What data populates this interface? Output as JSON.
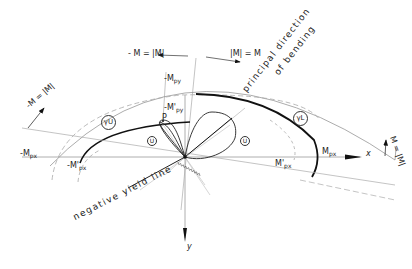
{
  "diagram": {
    "type": "yield-curve-diagram",
    "axes": {
      "x_label": "x",
      "y_label": "y"
    },
    "labels": {
      "minus_M_abs_top": "- M = |M|",
      "abs_M_eq_M": "|M| = M",
      "minus_M_abs_left": "-M = |M|",
      "M_abs_right": "M = |M|",
      "minus_Mpy": "-M",
      "minus_Mpy_sub": "py",
      "minus_Mpy_prime": "-M'",
      "minus_Mpy_prime_sub": "py",
      "minus_Mpx": "-M",
      "minus_Mpx_sub": "px",
      "minus_Mpx_prime": "-M'",
      "minus_Mpx_prime_sub": "px",
      "Mpx": "M",
      "Mpx_sub": "px",
      "Mpx_prime": "M'",
      "Mpx_prime_sub": "px",
      "point_P": "P",
      "gamma_U": "γU",
      "gamma_L": "γL",
      "U_left": "U",
      "U_right": "U",
      "principal_direction": "principal direction",
      "of_bending": "of bending",
      "negative_yield_line": "negative yield line"
    }
  }
}
